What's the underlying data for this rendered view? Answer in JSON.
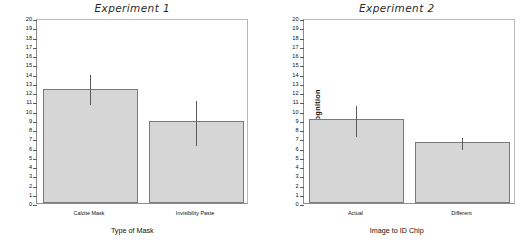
{
  "figure": {
    "panels": [
      {
        "title": "Experiment 1",
        "ylabel": "Recognition",
        "xlabel": "Type of Mask",
        "categories": [
          "Calcite Mask",
          "Invisibility Paste"
        ],
        "values": [
          12.35,
          8.9
        ],
        "err_low": [
          10.8,
          6.35
        ],
        "err_high": [
          14.1,
          11.2
        ]
      },
      {
        "title": "Experiment 2",
        "ylabel": "Recognition",
        "xlabel": "Image to ID Chip",
        "categories": [
          "Actual",
          "Different"
        ],
        "values": [
          9.1,
          6.55
        ],
        "err_low": [
          7.4,
          5.9
        ],
        "err_high": [
          10.75,
          7.2
        ]
      }
    ],
    "yticks": [
      "20",
      "19",
      "18",
      "17",
      "16",
      "15",
      "14",
      "13",
      "12",
      "11",
      "10",
      "9",
      "8",
      "7",
      "6",
      "5",
      "4",
      "3",
      "2",
      "1",
      "0"
    ],
    "colors": {
      "bar_fill": "#d6d6d6",
      "bar_edge": "#7a7a7a",
      "error_bar": "#5b5b5b",
      "axis": "#8d8d8d",
      "text": "#111111",
      "background": "#ffffff"
    }
  },
  "chart_data": [
    {
      "type": "bar",
      "title": "Experiment 1",
      "xlabel": "Type of Mask",
      "ylabel": "Recognition",
      "categories": [
        "Calcite Mask",
        "Invisibility Paste"
      ],
      "values": [
        12.35,
        8.9
      ],
      "error_low": [
        10.8,
        6.35
      ],
      "error_high": [
        14.1,
        11.2
      ],
      "ylim": [
        0,
        20
      ],
      "ytick_step": 1,
      "grid": false,
      "legend": "none"
    },
    {
      "type": "bar",
      "title": "Experiment 2",
      "xlabel": "Image to ID Chip",
      "ylabel": "Recognition",
      "categories": [
        "Actual",
        "Different"
      ],
      "values": [
        9.1,
        6.55
      ],
      "error_low": [
        7.4,
        5.9
      ],
      "error_high": [
        10.75,
        7.2
      ],
      "ylim": [
        0,
        20
      ],
      "ytick_step": 1,
      "grid": false,
      "legend": "none"
    }
  ]
}
